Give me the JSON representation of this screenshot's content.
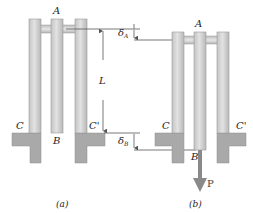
{
  "figure_a": {
    "caption": "(a)",
    "labels": {
      "top": "A",
      "bottom_mid": "B",
      "left": "C",
      "right": "C'"
    }
  },
  "figure_b": {
    "caption": "(b)",
    "labels": {
      "top": "A",
      "bottom_mid": "B",
      "left": "C",
      "right": "C'",
      "load": "P"
    }
  },
  "dimensions": {
    "length": "L",
    "delta_a": {
      "symbol": "δ",
      "subscript": "A"
    },
    "delta_b": {
      "symbol": "δ",
      "subscript": "B"
    }
  },
  "colors": {
    "bar_light": "#d8d8d8",
    "bar_dark": "#b0b0b0",
    "support": "#a9a9a9",
    "dimension_line": "#555555",
    "arrow": "#8a8a8a"
  }
}
